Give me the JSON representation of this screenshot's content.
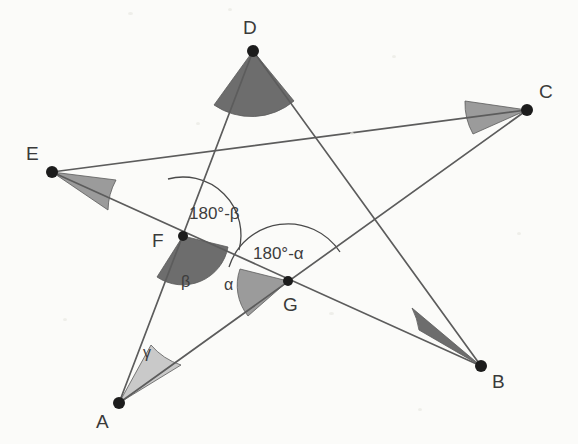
{
  "figure": {
    "background_color": "#fbfbf9",
    "line_color": "#5c5c5c",
    "dot_color": "#1c1c1c",
    "arc_color": "#4a4a4a",
    "wedge_dark_color": "#6d6d6d",
    "wedge_mid_color": "#9b9b9b",
    "wedge_light_color": "#c9c9c9"
  },
  "points": {
    "A": {
      "label": "A",
      "x": 119,
      "y": 403,
      "label_x": 96,
      "label_y": 412,
      "kind": "star-vertex"
    },
    "B": {
      "label": "B",
      "x": 481,
      "y": 366,
      "label_x": 492,
      "label_y": 372,
      "kind": "star-vertex"
    },
    "C": {
      "label": "C",
      "x": 527,
      "y": 110,
      "label_x": 539,
      "label_y": 82,
      "kind": "star-vertex"
    },
    "D": {
      "label": "D",
      "x": 253,
      "y": 51,
      "label_x": 243,
      "label_y": 18,
      "kind": "star-vertex"
    },
    "E": {
      "label": "E",
      "x": 52,
      "y": 172,
      "label_x": 26,
      "label_y": 144,
      "kind": "star-vertex"
    },
    "F": {
      "label": "F",
      "x": 183,
      "y": 236,
      "label_x": 152,
      "label_y": 231,
      "kind": "intersection"
    },
    "G": {
      "label": "G",
      "x": 288,
      "y": 281,
      "label_x": 283,
      "label_y": 295,
      "kind": "intersection"
    }
  },
  "edges": [
    {
      "name": "A-D",
      "from": "A",
      "to": "D"
    },
    {
      "name": "A-C",
      "from": "A",
      "to": "C"
    },
    {
      "name": "E-C",
      "from": "E",
      "to": "C"
    },
    {
      "name": "E-B",
      "from": "E",
      "to": "B"
    },
    {
      "name": "D-B",
      "from": "D",
      "to": "B"
    }
  ],
  "angles": [
    {
      "name": "angle-at-A",
      "label": "γ",
      "vertex": "A",
      "label_x": 143,
      "label_y": 345,
      "shade": "light",
      "radius": 52
    },
    {
      "name": "angle-at-B",
      "label": "",
      "vertex": "B",
      "shade": "dark",
      "radius": 55
    },
    {
      "name": "angle-at-C",
      "label": "",
      "vertex": "C",
      "shade": "mid",
      "radius": 52
    },
    {
      "name": "angle-at-D",
      "label": "",
      "vertex": "D",
      "shade": "dark",
      "radius": 52
    },
    {
      "name": "angle-at-E",
      "label": "",
      "vertex": "E",
      "shade": "mid",
      "radius": 55
    },
    {
      "name": "angle-beta-at-F",
      "label": "β",
      "vertex": "F",
      "label_x": 181,
      "label_y": 274,
      "shade": "dark",
      "radius": 44
    },
    {
      "name": "angle-supplement-beta-at-F",
      "label": "180°-β",
      "vertex": "F",
      "label_x": 189,
      "label_y": 205,
      "shade": "none",
      "radius": 56
    },
    {
      "name": "angle-alpha-at-G",
      "label": "α",
      "vertex": "G",
      "label_x": 224,
      "label_y": 277,
      "shade": "mid",
      "radius": 48
    },
    {
      "name": "angle-supplement-alpha-at-G",
      "label": "180°-α",
      "vertex": "G",
      "label_x": 253,
      "label_y": 245,
      "shade": "none",
      "radius": 62
    }
  ]
}
